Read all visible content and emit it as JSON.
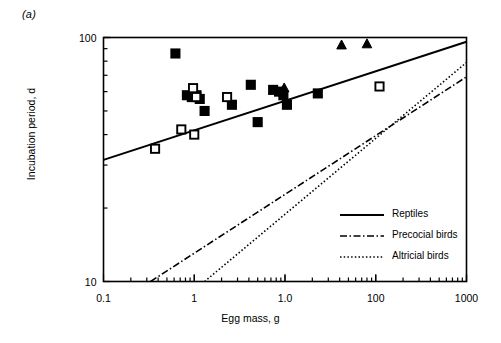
{
  "figure": {
    "panel_label": "(a)",
    "ylabel": "Incubation period, d",
    "xlabel": "Egg mass, g"
  },
  "axes": {
    "y_ticks": [
      {
        "value": 100,
        "label": "100"
      },
      {
        "value": 10,
        "label": "10"
      }
    ],
    "x_ticks": [
      {
        "value": 0.1,
        "label": "0.1"
      },
      {
        "value": 1,
        "label": "1"
      },
      {
        "value": 10,
        "label": "1.0"
      },
      {
        "value": 100,
        "label": "100"
      },
      {
        "value": 1000,
        "label": "1000"
      }
    ]
  },
  "legend": {
    "items": [
      {
        "label": "Reptiles",
        "style": "solid",
        "color": "#000000"
      },
      {
        "label": "Precocial birds",
        "style": "dash-dot",
        "color": "#000000"
      },
      {
        "label": "Altricial birds",
        "style": "dotted",
        "color": "#000000"
      }
    ]
  },
  "chart_data": {
    "type": "scatter",
    "title": "",
    "xlabel": "Egg mass, g",
    "ylabel": "Incubation period, d",
    "xscale": "log",
    "yscale": "log",
    "xlim": [
      0.1,
      1000
    ],
    "ylim": [
      10,
      100
    ],
    "grid": false,
    "legend_position": "center-right",
    "series": [
      {
        "name": "Reptiles",
        "type": "line",
        "style": "solid",
        "color": "#000000",
        "x": [
          0.1,
          1000
        ],
        "y": [
          31.5,
          96
        ]
      },
      {
        "name": "Precocial birds",
        "type": "line",
        "style": "dash-dot",
        "color": "#000000",
        "x": [
          0.33,
          1000
        ],
        "y": [
          10,
          69
        ]
      },
      {
        "name": "Altricial birds",
        "type": "line",
        "style": "dotted",
        "color": "#000000",
        "x": [
          1.3,
          1000
        ],
        "y": [
          10,
          79
        ]
      },
      {
        "name": "Filled squares",
        "type": "scatter",
        "marker": "filled-square",
        "color": "#000000",
        "points": [
          {
            "x": 0.62,
            "y": 86
          },
          {
            "x": 0.83,
            "y": 58
          },
          {
            "x": 0.94,
            "y": 57
          },
          {
            "x": 1.06,
            "y": 58
          },
          {
            "x": 1.15,
            "y": 56
          },
          {
            "x": 1.3,
            "y": 50
          },
          {
            "x": 4.2,
            "y": 64
          },
          {
            "x": 7.4,
            "y": 61
          },
          {
            "x": 8.6,
            "y": 60
          },
          {
            "x": 9.6,
            "y": 58
          },
          {
            "x": 10.5,
            "y": 53
          },
          {
            "x": 5.0,
            "y": 45
          },
          {
            "x": 23.0,
            "y": 59
          },
          {
            "x": 2.6,
            "y": 53
          }
        ]
      },
      {
        "name": "Open squares",
        "type": "scatter",
        "marker": "open-square",
        "color": "#000000",
        "points": [
          {
            "x": 0.37,
            "y": 35
          },
          {
            "x": 0.72,
            "y": 42
          },
          {
            "x": 1.0,
            "y": 40
          },
          {
            "x": 0.97,
            "y": 62
          },
          {
            "x": 1.05,
            "y": 57
          },
          {
            "x": 2.3,
            "y": 57
          },
          {
            "x": 110.0,
            "y": 63
          }
        ]
      },
      {
        "name": "Filled triangles",
        "type": "scatter",
        "marker": "filled-triangle",
        "color": "#000000",
        "points": [
          {
            "x": 42.0,
            "y": 93
          },
          {
            "x": 80.0,
            "y": 94
          },
          {
            "x": 9.8,
            "y": 62
          }
        ]
      }
    ]
  }
}
